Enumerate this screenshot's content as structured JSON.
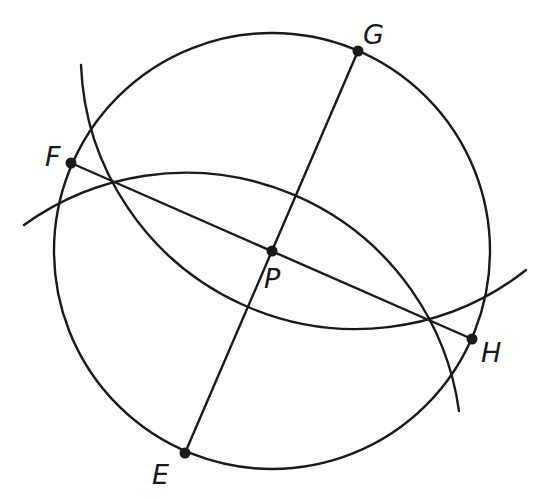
{
  "diagram": {
    "stroke_color": "#1a1a1a",
    "background": "#ffffff",
    "circle": {
      "center": "P",
      "cx": 272,
      "cy": 251,
      "r": 218
    },
    "points": [
      {
        "name": "E",
        "x": 185,
        "y": 453,
        "label": "E",
        "label_x": 152,
        "label_y": 484
      },
      {
        "name": "F",
        "x": 71,
        "y": 163,
        "label": "F",
        "label_x": 45,
        "label_y": 166
      },
      {
        "name": "G",
        "x": 358,
        "y": 51,
        "label": "G",
        "label_x": 363,
        "label_y": 44
      },
      {
        "name": "H",
        "x": 472,
        "y": 339,
        "label": "H",
        "label_x": 481,
        "label_y": 362
      },
      {
        "name": "P",
        "x": 272,
        "y": 251,
        "label": "P",
        "label_x": 264,
        "label_y": 288
      }
    ],
    "segments": [
      {
        "name": "FH",
        "from": "F",
        "to": "H"
      },
      {
        "name": "EG",
        "from": "E",
        "to": "G"
      }
    ],
    "arcs": [
      {
        "name": "arc-centered-E",
        "center": "E",
        "r": 276,
        "start": [
          24,
          225
        ],
        "end": [
          459,
          411
        ]
      },
      {
        "name": "arc-centered-G",
        "center": "G",
        "r": 275,
        "start": [
          81,
          65
        ],
        "end": [
          526,
          270
        ]
      }
    ],
    "labels": {
      "E": "E",
      "F": "F",
      "G": "G",
      "H": "H",
      "P": "P"
    }
  }
}
